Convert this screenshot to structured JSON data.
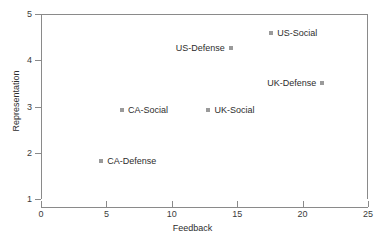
{
  "chart_data": {
    "type": "scatter",
    "title": "",
    "xlabel": "Feedback",
    "ylabel": "Representation",
    "xlim": [
      0,
      25
    ],
    "ylim": [
      1,
      5
    ],
    "xticks": [
      "0",
      "5",
      "10",
      "15",
      "20",
      "25"
    ],
    "yticks": [
      "1",
      "2",
      "3",
      "4",
      "5"
    ],
    "grid": false,
    "legend": "none",
    "marker_color": "#9a9a9a",
    "text_color": "#2d2d2d",
    "axis_color": "#8a8a8a",
    "points": [
      {
        "label": "US-Social",
        "x": 17.6,
        "y": 4.6,
        "label_side": "right"
      },
      {
        "label": "US-Defense",
        "x": 14.5,
        "y": 4.26,
        "label_side": "left"
      },
      {
        "label": "UK-Defense",
        "x": 21.5,
        "y": 3.5,
        "label_side": "left"
      },
      {
        "label": "CA-Social",
        "x": 6.2,
        "y": 2.93,
        "label_side": "right"
      },
      {
        "label": "UK-Social",
        "x": 12.8,
        "y": 2.93,
        "label_side": "right"
      },
      {
        "label": "CA-Defense",
        "x": 4.6,
        "y": 1.83,
        "label_side": "right"
      }
    ]
  }
}
